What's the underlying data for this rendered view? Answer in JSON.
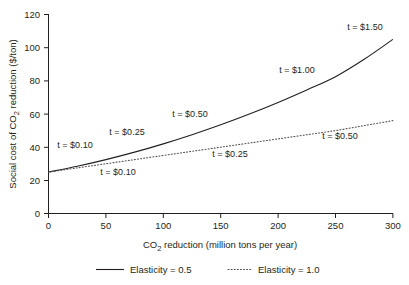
{
  "chart_data": {
    "type": "line",
    "title": "",
    "xlabel": "CO2 reduction (million tons per year)",
    "xlabel_parts": {
      "pre": "CO",
      "sub": "2",
      "post": " reduction (million tons per year)"
    },
    "ylabel": "Social cost of CO2 reduction ($/ton)",
    "ylabel_parts": {
      "pre": "Social cost of CO",
      "sub": "2",
      "post": " reduction ($/ton)"
    },
    "xlim": [
      0,
      300
    ],
    "ylim": [
      0,
      120
    ],
    "xticks": [
      0,
      50,
      100,
      150,
      200,
      250,
      300
    ],
    "yticks": [
      0,
      20,
      40,
      60,
      80,
      100,
      120
    ],
    "xticklabels": [
      "0",
      "50",
      "100",
      "150",
      "200",
      "250",
      "300"
    ],
    "yticklabels": [
      "0",
      "20",
      "40",
      "60",
      "80",
      "100",
      "120"
    ],
    "grid": false,
    "legend_position": "below-axes",
    "series": [
      {
        "name": "Elasticity = 0.5",
        "style": "solid",
        "color": "#231f20",
        "x": [
          0,
          25,
          50,
          75,
          100,
          125,
          150,
          175,
          200,
          225,
          250,
          275,
          300
        ],
        "values": [
          25,
          28.5,
          32.5,
          37,
          42,
          47.5,
          53.5,
          60,
          67,
          74.5,
          82.5,
          93,
          105
        ]
      },
      {
        "name": "Elasticity = 1.0",
        "style": "dotted",
        "color": "#555052",
        "x": [
          0,
          25,
          50,
          75,
          100,
          125,
          150,
          175,
          200,
          225,
          250,
          275,
          300
        ],
        "values": [
          25,
          27.5,
          30,
          32.5,
          35,
          37.5,
          40,
          42.5,
          45,
          47.5,
          50,
          53,
          56
        ]
      }
    ],
    "annotations": [
      {
        "text": "t = $0.10",
        "series": "Elasticity = 0.5",
        "x": 15,
        "y": 40,
        "px": 75,
        "py": 148
      },
      {
        "text": "t = $0.25",
        "series": "Elasticity = 0.5",
        "x": 63,
        "y": 48,
        "px": 127,
        "py": 135
      },
      {
        "text": "t = $0.50",
        "series": "Elasticity = 0.5",
        "x": 120,
        "y": 62,
        "px": 190,
        "py": 117
      },
      {
        "text": "t = $1.00",
        "series": "Elasticity = 0.5",
        "x": 208,
        "y": 86,
        "px": 297,
        "py": 73
      },
      {
        "text": "t = $1.50",
        "series": "Elasticity = 0.5",
        "x": 268,
        "y": 108,
        "px": 365,
        "py": 30
      },
      {
        "text": "t = $0.10",
        "series": "Elasticity = 1.0",
        "x": 40,
        "y": 22,
        "px": 118,
        "py": 175
      },
      {
        "text": "t = $0.25",
        "series": "Elasticity = 1.0",
        "x": 150,
        "y": 34,
        "px": 230,
        "py": 157
      },
      {
        "text": "t = $0.50",
        "series": "Elasticity = 1.0",
        "x": 248,
        "y": 44,
        "px": 340,
        "py": 139
      }
    ],
    "legend": [
      {
        "label": "Elasticity = 0.5",
        "style": "solid",
        "color": "#231f20"
      },
      {
        "label": "Elasticity = 1.0",
        "style": "dotted",
        "color": "#555052"
      }
    ]
  }
}
